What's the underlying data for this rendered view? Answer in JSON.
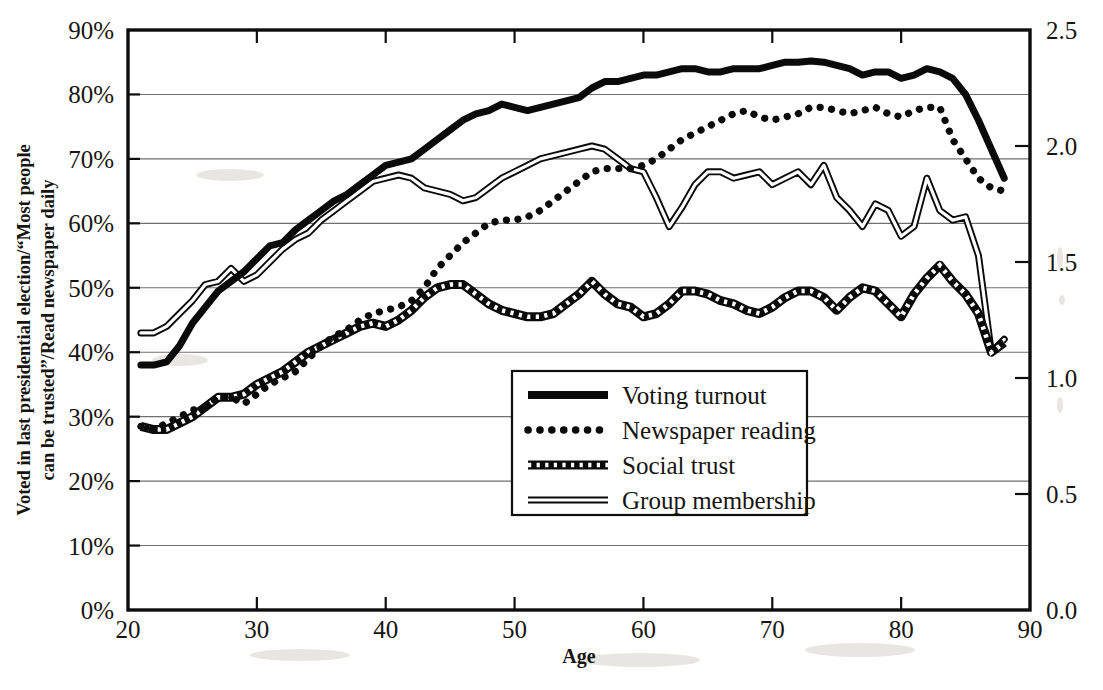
{
  "chart_data": {
    "type": "line",
    "title": "",
    "xlabel": "Age",
    "ylabel_line1": "Voted in last presidential election/“Most people",
    "ylabel_line2": "can be trusted”/Read newspaper daily",
    "xlim": [
      20,
      90
    ],
    "ylim": [
      0,
      0.9
    ],
    "y2lim": [
      0.0,
      2.5
    ],
    "grid": true,
    "legend_position": "center",
    "x_ticks": [
      "20",
      "30",
      "40",
      "50",
      "60",
      "70",
      "80",
      "90"
    ],
    "x_tick_values": [
      20,
      30,
      40,
      50,
      60,
      70,
      80,
      90
    ],
    "y_ticks": [
      "0%",
      "10%",
      "20%",
      "30%",
      "40%",
      "50%",
      "60%",
      "70%",
      "80%",
      "90%"
    ],
    "y_tick_values": [
      0,
      10,
      20,
      30,
      40,
      50,
      60,
      70,
      80,
      90
    ],
    "y2_ticks": [
      "0.0",
      "0.5",
      "1.0",
      "1.5",
      "2.0",
      "2.5"
    ],
    "y2_tick_values": [
      0.0,
      0.5,
      1.0,
      1.5,
      2.0,
      2.5
    ],
    "x": [
      21,
      22,
      23,
      24,
      25,
      26,
      27,
      28,
      29,
      30,
      31,
      32,
      33,
      34,
      35,
      36,
      37,
      38,
      39,
      40,
      41,
      42,
      43,
      44,
      45,
      46,
      47,
      48,
      49,
      50,
      51,
      52,
      53,
      54,
      55,
      56,
      57,
      58,
      59,
      60,
      61,
      62,
      63,
      64,
      65,
      66,
      67,
      68,
      69,
      70,
      71,
      72,
      73,
      74,
      75,
      76,
      77,
      78,
      79,
      80,
      81,
      82,
      83,
      84,
      85,
      86,
      87,
      88
    ],
    "series": [
      {
        "name": "Voting turnout",
        "style": "solid-thick",
        "values": [
          38,
          38,
          38.5,
          41,
          44.5,
          47,
          49.5,
          51,
          52.5,
          54.5,
          56.5,
          57,
          59,
          60.5,
          62,
          63.5,
          64.5,
          66,
          67.5,
          69,
          69.5,
          70,
          71.5,
          73,
          74.5,
          76,
          77,
          77.5,
          78.5,
          78,
          77.5,
          78,
          78.5,
          79,
          79.5,
          81,
          82,
          82,
          82.5,
          83,
          83,
          83.5,
          84,
          84,
          83.5,
          83.5,
          84,
          84,
          84,
          84.5,
          85,
          85,
          85.2,
          85,
          84.5,
          84,
          83,
          83.5,
          83.5,
          82.5,
          83,
          84,
          83.5,
          82.5,
          80,
          76,
          71.5,
          67
        ]
      },
      {
        "name": "Newspaper reading",
        "style": "dotted",
        "values": [
          28.5,
          28,
          29,
          30,
          31,
          31.5,
          33,
          33,
          32,
          33.5,
          35,
          36,
          37,
          39,
          41,
          42.5,
          43.5,
          45,
          46,
          46.5,
          47,
          48,
          50,
          53,
          55,
          57,
          58.5,
          60,
          60.5,
          60.5,
          61,
          62,
          63.5,
          65,
          66.5,
          68,
          68.5,
          68.5,
          68.5,
          69,
          70,
          71.5,
          73,
          74,
          75,
          76,
          77,
          77.5,
          76.5,
          76,
          76.5,
          77,
          78,
          78,
          77.5,
          77,
          77.5,
          78,
          77,
          76.5,
          77.5,
          78,
          78,
          73,
          70,
          67,
          65.5,
          65
        ]
      },
      {
        "name": "Social trust",
        "style": "dashed",
        "values": [
          28.5,
          28,
          28,
          29,
          30,
          31.5,
          33,
          33,
          33.5,
          35,
          36,
          37,
          38.5,
          40,
          41,
          42,
          43,
          44,
          44.5,
          44,
          45,
          46.5,
          48.5,
          50,
          50.5,
          50.5,
          49,
          47.5,
          46.5,
          46,
          45.5,
          45.5,
          46,
          47.5,
          49,
          51,
          49,
          47.5,
          47,
          45.5,
          46,
          47.5,
          49.5,
          49.5,
          49,
          48,
          47.5,
          46.5,
          46,
          47,
          48.5,
          49.5,
          49.5,
          48.5,
          46.5,
          48.5,
          50,
          49.5,
          47.5,
          45.5,
          49,
          51.5,
          53.5,
          51,
          49,
          46,
          40,
          41.5
        ]
      },
      {
        "name": "Group membership",
        "style": "double",
        "values": [
          43,
          43,
          44,
          46,
          48,
          50.5,
          51,
          53,
          51,
          52,
          54,
          56,
          57.5,
          58.5,
          60.5,
          62,
          63.5,
          65,
          66.5,
          67,
          67.5,
          67,
          65.5,
          65,
          64.5,
          63.5,
          64,
          65.5,
          67,
          68,
          69,
          70,
          70.5,
          71,
          71.5,
          72,
          71.5,
          70,
          68.5,
          68,
          64,
          59.5,
          62.5,
          66,
          68,
          68,
          67,
          67.5,
          68,
          66,
          67,
          68,
          66,
          69,
          64,
          62,
          59.5,
          63,
          62,
          58,
          59.5,
          67,
          62,
          60.5,
          61,
          55,
          40,
          42
        ]
      }
    ]
  }
}
